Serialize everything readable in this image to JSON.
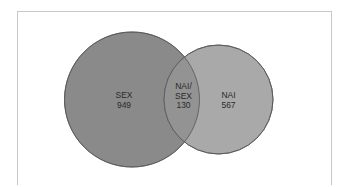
{
  "diagram": {
    "type": "venn",
    "colors": {
      "frame_border": "#c8c8c8",
      "background": "#ffffff",
      "set_a_fill": "#8a8a8a",
      "set_b_fill": "#a9a9a9",
      "overlap_fill": "#939393",
      "outline": "#555555",
      "text": "#2a2a2a"
    },
    "sets": [
      {
        "id": "sex",
        "label": "SEX",
        "value": "949"
      },
      {
        "id": "nai",
        "label": "NAI",
        "value": "567"
      }
    ],
    "intersection": {
      "label_line1": "NAI/",
      "label_line2": "SEX",
      "value": "130"
    }
  }
}
